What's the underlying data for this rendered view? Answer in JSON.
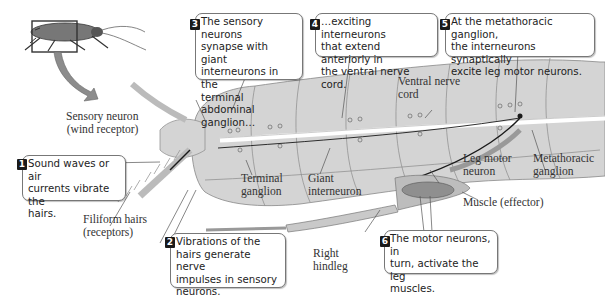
{
  "diagram": {
    "inset": {
      "subject": "cockroach",
      "highlight_box": "rear abdomen with cerci"
    },
    "labels": {
      "sensory_neuron": [
        "Sensory neuron",
        "(wind receptor)"
      ],
      "filiform_hairs": [
        "Filiform hairs",
        "(receptors)"
      ],
      "terminal_ganglion": [
        "Terminal",
        "ganglion"
      ],
      "giant_interneuron": [
        "Giant",
        "interneuron"
      ],
      "ventral_nerve_cord": [
        "Ventral nerve",
        "cord"
      ],
      "leg_motor_neuron": [
        "Leg motor",
        "neuron"
      ],
      "metathoracic_ganglion": [
        "Metathoracic",
        "ganglion"
      ],
      "muscle": [
        "Muscle (effector)"
      ],
      "right_hindleg": [
        "Right",
        "hindleg"
      ]
    },
    "steps": [
      {
        "number": "1",
        "lines": [
          "Sound waves or air",
          "currents vibrate the",
          "hairs."
        ]
      },
      {
        "number": "2",
        "lines": [
          "Vibrations of the",
          "hairs generate nerve",
          "impulses in sensory",
          "neurons."
        ]
      },
      {
        "number": "3",
        "lines": [
          "The sensory neurons",
          "synapse with giant",
          "interneurons in the",
          "terminal abdominal",
          "ganglion…"
        ]
      },
      {
        "number": "4",
        "lines": [
          "…exciting interneurons",
          "that extend anteriorly in",
          "the ventral nerve cord."
        ]
      },
      {
        "number": "5",
        "lines": [
          "At the metathoracic ganglion,",
          "the interneurons synaptically",
          "excite leg motor neurons."
        ]
      },
      {
        "number": "6",
        "lines": [
          "The motor neurons, in",
          "turn, activate the leg",
          "muscles."
        ]
      }
    ],
    "colors": {
      "body_fill": "#d4d4d4",
      "segment_line": "#8a8a8a",
      "nerve_cord": "#ffffff",
      "neuron": "#1a1a1a",
      "badge": "#1a1a1a",
      "arrow": "#8c8c8c"
    }
  }
}
